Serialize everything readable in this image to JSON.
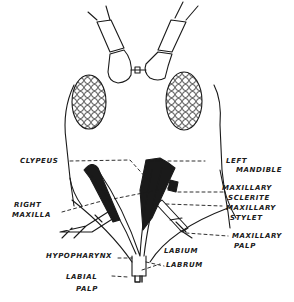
{
  "diagram": {
    "colors": {
      "ink": "#1a1a1a",
      "background": "#ffffff"
    },
    "labels": {
      "clypeus": "CLYPEUS",
      "right_maxilla_1": "RIGHT",
      "right_maxilla_2": "MAXILLA",
      "left_mandible_1": "LEFT",
      "left_mandible_2": "MANDIBLE",
      "maxillary_sclerite_1": "MAXILLARY",
      "maxillary_sclerite_2": "SCLERITE",
      "maxillary_stylet_1": "MAXILLARY",
      "maxillary_stylet_2": "STYLET",
      "maxillary_palp_1": "MAXILLARY",
      "maxillary_palp_2": "PALP",
      "hypopharynx": "HYPOPHARYNX",
      "labium": "LABIUM",
      "labrum": "LABRUM",
      "labial_palp_1": "LABIAL",
      "labial_palp_2": "PALP"
    }
  }
}
